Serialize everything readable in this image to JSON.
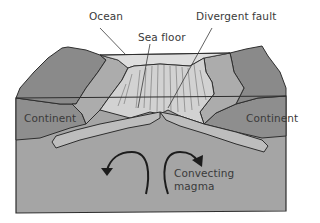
{
  "diagram": {
    "labels": {
      "ocean": "Ocean",
      "sea_floor": "Sea floor",
      "divergent_fault": "Divergent fault",
      "continent_left": "Continent",
      "continent_right": "Continent",
      "convecting_magma_line1": "Convecting",
      "convecting_magma_line2": "magma"
    },
    "colors": {
      "background": "#ffffff",
      "mountain_dark": "#8c8c8c",
      "mountain_mid": "#a9a9a9",
      "sea_floor_ridge": "#cfcfcf",
      "ocean_water": "#dcdcdc",
      "continent_block": "#8f8f8f",
      "plate_slab": "#bdbdbd",
      "mantle": "#a4a4a4",
      "outline": "#2e2e2e",
      "text": "#3a3a3a"
    }
  }
}
